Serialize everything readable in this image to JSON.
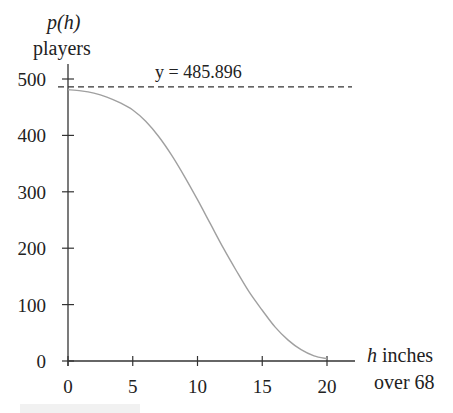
{
  "chart_data": {
    "type": "line",
    "title": "",
    "ylabel_line1": "p(h)",
    "ylabel_line2": "players",
    "xlabel_line1": "h inches",
    "xlabel_line2": "over 68",
    "x_ticks": [
      "0",
      "5",
      "10",
      "15",
      "20"
    ],
    "y_ticks": [
      "0",
      "100",
      "200",
      "300",
      "400",
      "500"
    ],
    "xlim": [
      0,
      22
    ],
    "ylim": [
      0,
      520
    ],
    "asymptote": {
      "y": 485.896,
      "label": "y = 485.896",
      "style": "dashed"
    },
    "series": [
      {
        "name": "p(h)",
        "x": [
          0,
          1,
          2,
          3,
          4,
          5,
          6,
          7,
          8,
          9,
          10,
          11,
          12,
          13,
          14,
          15,
          16,
          17,
          18,
          19,
          20
        ],
        "values": [
          481,
          479,
          475,
          468,
          458,
          445,
          425,
          398,
          365,
          327,
          286,
          243,
          200,
          160,
          122,
          90,
          60,
          37,
          20,
          9,
          4
        ]
      }
    ],
    "grid": false,
    "legend": "none",
    "colors": {
      "curve": "#a0a0a0",
      "axes": "#333333",
      "asymptote": "#333333"
    }
  },
  "caption": ""
}
